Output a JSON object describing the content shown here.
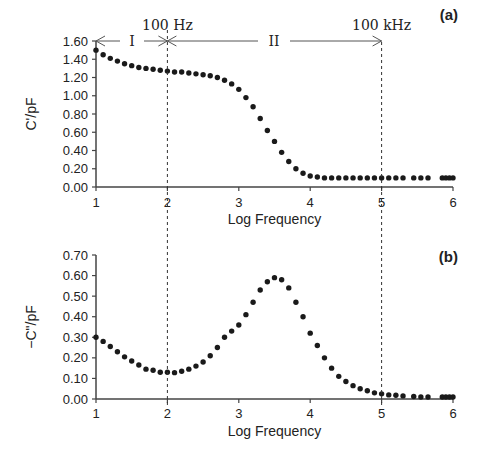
{
  "chart_data": [
    {
      "type": "scatter",
      "panel_label": "(a)",
      "title": "",
      "xlabel": "Log Frequency",
      "ylabel": "C'/pF",
      "xlim": [
        1,
        6
      ],
      "ylim": [
        0,
        1.6
      ],
      "x_ticks": [
        "1",
        "2",
        "3",
        "4",
        "5",
        "6"
      ],
      "y_ticks": [
        "0.00",
        "0.20",
        "0.40",
        "0.60",
        "0.80",
        "1.00",
        "1.20",
        "1.40",
        "1.60"
      ],
      "grid": false,
      "annotations": {
        "vline_1": {
          "x": 2,
          "label": "100 Hz"
        },
        "vline_2": {
          "x": 5,
          "label": "100 kHz"
        },
        "region_1": "I",
        "region_2": "II"
      },
      "series": [
        {
          "name": "C'",
          "x": [
            1.0,
            1.1,
            1.2,
            1.3,
            1.4,
            1.5,
            1.6,
            1.7,
            1.8,
            1.9,
            2.0,
            2.1,
            2.2,
            2.3,
            2.4,
            2.5,
            2.6,
            2.7,
            2.8,
            2.9,
            3.0,
            3.1,
            3.2,
            3.3,
            3.4,
            3.5,
            3.6,
            3.7,
            3.8,
            3.9,
            4.0,
            4.1,
            4.2,
            4.3,
            4.4,
            4.5,
            4.6,
            4.7,
            4.8,
            4.9,
            5.0,
            5.1,
            5.2,
            5.3,
            5.45,
            5.55,
            5.65,
            5.85,
            5.9,
            5.95,
            6.0
          ],
          "values": [
            1.5,
            1.45,
            1.41,
            1.38,
            1.35,
            1.33,
            1.31,
            1.3,
            1.29,
            1.28,
            1.27,
            1.26,
            1.26,
            1.25,
            1.24,
            1.23,
            1.22,
            1.2,
            1.17,
            1.13,
            1.07,
            0.98,
            0.88,
            0.75,
            0.62,
            0.5,
            0.38,
            0.28,
            0.2,
            0.15,
            0.12,
            0.11,
            0.1,
            0.1,
            0.1,
            0.1,
            0.1,
            0.1,
            0.1,
            0.1,
            0.1,
            0.1,
            0.1,
            0.1,
            0.1,
            0.1,
            0.1,
            0.1,
            0.1,
            0.1,
            0.1
          ]
        }
      ]
    },
    {
      "type": "scatter",
      "panel_label": "(b)",
      "title": "",
      "xlabel": "Log Frequency",
      "ylabel": "−C\"/pF",
      "xlim": [
        1,
        6
      ],
      "ylim": [
        0,
        0.7
      ],
      "x_ticks": [
        "1",
        "2",
        "3",
        "4",
        "5",
        "6"
      ],
      "y_ticks": [
        "0.00",
        "0.10",
        "0.20",
        "0.30",
        "0.40",
        "0.50",
        "0.60",
        "0.70"
      ],
      "grid": false,
      "series": [
        {
          "name": "-C\"",
          "x": [
            1.0,
            1.1,
            1.2,
            1.3,
            1.4,
            1.5,
            1.6,
            1.7,
            1.8,
            1.9,
            2.0,
            2.1,
            2.2,
            2.3,
            2.4,
            2.5,
            2.6,
            2.7,
            2.8,
            2.9,
            3.0,
            3.1,
            3.2,
            3.3,
            3.4,
            3.5,
            3.6,
            3.7,
            3.8,
            3.9,
            4.0,
            4.1,
            4.2,
            4.3,
            4.4,
            4.5,
            4.6,
            4.7,
            4.8,
            4.9,
            5.0,
            5.1,
            5.2,
            5.3,
            5.45,
            5.55,
            5.65,
            5.85,
            5.9,
            5.95,
            6.0
          ],
          "values": [
            0.3,
            0.28,
            0.255,
            0.23,
            0.205,
            0.185,
            0.165,
            0.145,
            0.14,
            0.13,
            0.13,
            0.128,
            0.135,
            0.145,
            0.16,
            0.18,
            0.21,
            0.25,
            0.3,
            0.33,
            0.36,
            0.41,
            0.47,
            0.53,
            0.57,
            0.59,
            0.58,
            0.54,
            0.47,
            0.4,
            0.32,
            0.26,
            0.2,
            0.15,
            0.11,
            0.085,
            0.065,
            0.05,
            0.04,
            0.03,
            0.025,
            0.02,
            0.018,
            0.015,
            0.012,
            0.01,
            0.01,
            0.01,
            0.01,
            0.01,
            0.01
          ]
        }
      ]
    }
  ]
}
